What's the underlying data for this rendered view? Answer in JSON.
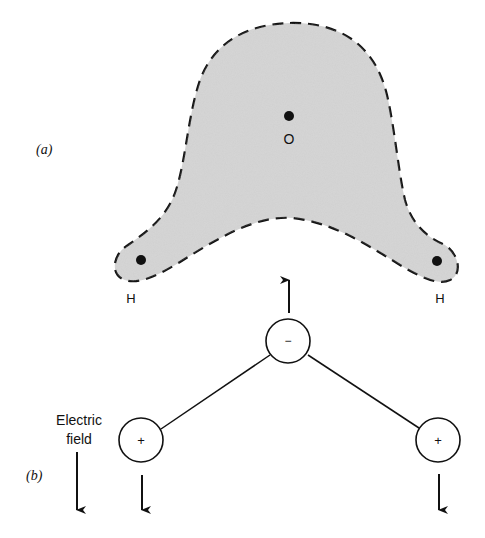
{
  "panel_a": {
    "label": "(a)",
    "oxygen_label": "O",
    "hydrogen_left_label": "H",
    "hydrogen_right_label": "H",
    "cloud_fill": "#d9d9d9"
  },
  "panel_b": {
    "label": "(b)",
    "field_label_line1": "Electric",
    "field_label_line2": "field",
    "negative_charge": "−",
    "positive_charge_left": "+",
    "positive_charge_right": "+"
  }
}
